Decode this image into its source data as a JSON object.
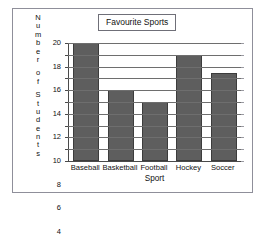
{
  "chart_data": {
    "type": "bar",
    "title": "Favourite Sports",
    "xlabel": "Sport",
    "ylabel": "Number of Students",
    "categories": [
      "Baseball",
      "Basketball",
      "Football",
      "Hockey",
      "Soccer"
    ],
    "values": [
      20,
      12,
      10,
      18,
      15
    ],
    "ylim": [
      0,
      20
    ],
    "yticks": [
      0,
      2,
      4,
      6,
      8,
      10,
      12,
      14,
      16,
      18,
      20
    ],
    "ytick_labels": [
      "0",
      "2",
      "4",
      "6",
      "8",
      "10",
      "12",
      "14",
      "16",
      "18",
      "20"
    ],
    "grid": true,
    "grid_axis": "y",
    "legend": false,
    "bar_color": "#5e5e5e",
    "bar_edge_color": "#3c3c3c",
    "grid_color": "#6e6e6e",
    "axis_color": "#4a4a4a",
    "frame_color": "#8f8f9a",
    "background": "#ffffff",
    "ylabel_chars": [
      "N",
      "u",
      "m",
      "b",
      "e",
      "r",
      "",
      "o",
      "f",
      "",
      "S",
      "t",
      "u",
      "d",
      "e",
      "n",
      "t",
      "s"
    ]
  }
}
